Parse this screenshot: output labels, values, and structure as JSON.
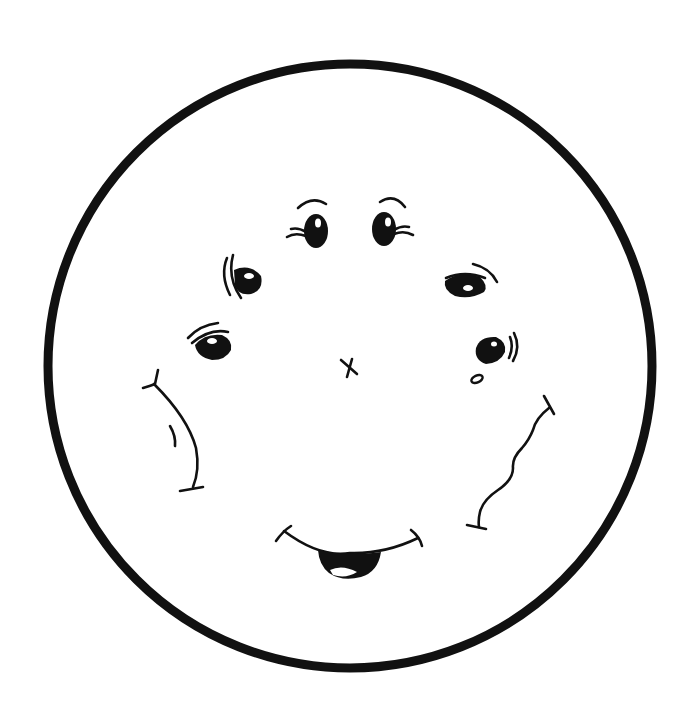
{
  "illustration": {
    "title": "",
    "colors": {
      "ink": "#111111",
      "background": "#ffffff"
    },
    "face_circle": {
      "cx": 350,
      "cy": 366,
      "r": 302,
      "stroke_width": 9
    },
    "elements": [
      {
        "name": "eye-top-left",
        "type": "eye",
        "cx": 316,
        "cy": 231
      },
      {
        "name": "eye-top-right",
        "type": "eye",
        "cx": 384,
        "cy": 229
      },
      {
        "name": "eye-upper-left",
        "type": "eye",
        "cx": 246,
        "cy": 279
      },
      {
        "name": "eye-upper-right",
        "type": "eye",
        "cx": 465,
        "cy": 285
      },
      {
        "name": "eye-lower-left",
        "type": "eye",
        "cx": 213,
        "cy": 345
      },
      {
        "name": "eye-lower-right",
        "type": "eye",
        "cx": 490,
        "cy": 350
      },
      {
        "name": "nose-x",
        "type": "nose",
        "cx": 350,
        "cy": 367
      },
      {
        "name": "left-cheek",
        "type": "cheek"
      },
      {
        "name": "right-cheek-wavy",
        "type": "cheek"
      },
      {
        "name": "mouth-smile",
        "type": "mouth"
      }
    ]
  }
}
